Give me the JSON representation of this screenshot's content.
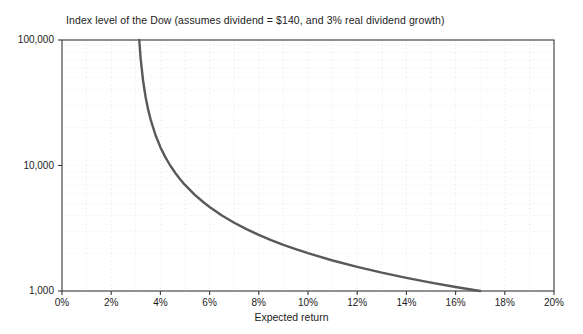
{
  "chart_data": {
    "type": "line",
    "title": "Index level of the Dow (assumes dividend = $140, and 3% real dividend growth)",
    "xlabel": "Expected return",
    "ylabel": "",
    "yscale": "log",
    "xlim": [
      0,
      20
    ],
    "ylim": [
      1000,
      100000
    ],
    "grid": true,
    "grid_style": "dotted",
    "legend": "none",
    "xticks": [
      0,
      2,
      4,
      6,
      8,
      10,
      12,
      14,
      16,
      18,
      20
    ],
    "xtick_labels": [
      "0%",
      "2%",
      "4%",
      "6%",
      "8%",
      "10%",
      "12%",
      "14%",
      "16%",
      "18%",
      "20%"
    ],
    "yticks": [
      1000,
      10000,
      100000
    ],
    "ytick_labels": [
      "1,000",
      "10,000",
      "100,000"
    ],
    "series": [
      {
        "name": "Index level of the Dow",
        "color": "#595959",
        "line_width": 2.4,
        "formula": "140 / (r - 0.03)",
        "x": [
          3.14,
          3.2,
          3.3,
          3.4,
          3.5,
          3.6,
          3.8,
          4.0,
          4.2,
          4.4,
          4.6,
          4.8,
          5.0,
          5.4,
          5.8,
          6.0,
          6.5,
          7.0,
          7.5,
          8.0,
          8.5,
          9.0,
          9.5,
          10.0,
          11.0,
          12.0,
          13.0,
          14.0,
          15.0,
          16.0,
          17.0
        ],
        "y": [
          100000,
          70000,
          46667,
          35000,
          28000,
          23333,
          17500,
          14000,
          11667,
          10000,
          8750,
          7778,
          7000,
          5833,
          5000,
          4667,
          4000,
          3500,
          3111,
          2800,
          2545,
          2333,
          2154,
          2000,
          1750,
          1556,
          1400,
          1273,
          1167,
          1077,
          1000
        ]
      }
    ]
  },
  "axes": {
    "y_labels": [
      "100,000",
      "10,000",
      "1,000"
    ],
    "x_labels": [
      "0%",
      "2%",
      "4%",
      "6%",
      "8%",
      "10%",
      "12%",
      "14%",
      "16%",
      "18%",
      "20%"
    ],
    "x_title": "Expected return"
  },
  "colors": {
    "curve": "#595959",
    "axis": "#3a3a3a",
    "grid": "#e9e9ee",
    "text": "#1c1c1c",
    "background": "#ffffff"
  }
}
